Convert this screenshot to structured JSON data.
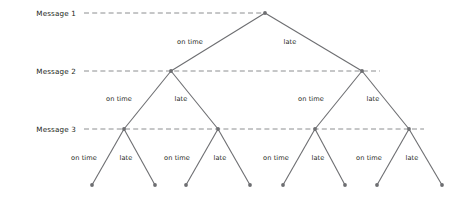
{
  "figure": {
    "type": "decision-tree-diagram",
    "width": 460,
    "height": 198,
    "background_color": "#ffffff",
    "stroke_color": "#6d6e71",
    "text_color": "#231f20",
    "dash_color": "#808285"
  },
  "levels": [
    {
      "id": "message-1",
      "label": "Message 1",
      "y": 13,
      "label_x": 76,
      "line_from_x": 84,
      "line_to_x": 265
    },
    {
      "id": "message-2",
      "label": "Message 2",
      "y": 71,
      "label_x": 76,
      "line_from_x": 84,
      "line_to_x": 380
    },
    {
      "id": "message-3",
      "label": "Message 3",
      "y": 129,
      "label_x": 76,
      "line_from_x": 84,
      "line_to_x": 424
    }
  ],
  "nodes": [
    {
      "id": "n0",
      "level": 0,
      "x": 265,
      "y": 13
    },
    {
      "id": "n1",
      "level": 1,
      "x": 171,
      "y": 71
    },
    {
      "id": "n2",
      "level": 1,
      "x": 362,
      "y": 71
    },
    {
      "id": "n11",
      "level": 2,
      "x": 124,
      "y": 129
    },
    {
      "id": "n12",
      "level": 2,
      "x": 218,
      "y": 129
    },
    {
      "id": "n21",
      "level": 2,
      "x": 315,
      "y": 129
    },
    {
      "id": "n22",
      "level": 2,
      "x": 409,
      "y": 129
    },
    {
      "id": "leaf1",
      "level": 3,
      "x": 92,
      "y": 185
    },
    {
      "id": "leaf2",
      "level": 3,
      "x": 155,
      "y": 185
    },
    {
      "id": "leaf3",
      "level": 3,
      "x": 186,
      "y": 185
    },
    {
      "id": "leaf4",
      "level": 3,
      "x": 250,
      "y": 185
    },
    {
      "id": "leaf5",
      "level": 3,
      "x": 283,
      "y": 185
    },
    {
      "id": "leaf6",
      "level": 3,
      "x": 345,
      "y": 185
    },
    {
      "id": "leaf7",
      "level": 3,
      "x": 377,
      "y": 185
    },
    {
      "id": "leaf8",
      "level": 3,
      "x": 442,
      "y": 185
    }
  ],
  "edges": [
    {
      "id": "e-n0-n1",
      "from": "n0",
      "to": "n1",
      "label": "on time",
      "label_x": 190,
      "label_y": 42
    },
    {
      "id": "e-n0-n2",
      "from": "n0",
      "to": "n2",
      "label": "late",
      "label_x": 290,
      "label_y": 42
    },
    {
      "id": "e-n1-n11",
      "from": "n1",
      "to": "n11",
      "label": "on time",
      "label_x": 119,
      "label_y": 99
    },
    {
      "id": "e-n1-n12",
      "from": "n1",
      "to": "n12",
      "label": "late",
      "label_x": 181,
      "label_y": 99
    },
    {
      "id": "e-n2-n21",
      "from": "n2",
      "to": "n21",
      "label": "on time",
      "label_x": 311,
      "label_y": 99
    },
    {
      "id": "e-n2-n22",
      "from": "n2",
      "to": "n22",
      "label": "late",
      "label_x": 373,
      "label_y": 99
    },
    {
      "id": "e-n11-leaf1",
      "from": "n11",
      "to": "leaf1",
      "label": "on time",
      "label_x": 84,
      "label_y": 158
    },
    {
      "id": "e-n11-leaf2",
      "from": "n11",
      "to": "leaf2",
      "label": "late",
      "label_x": 126,
      "label_y": 158
    },
    {
      "id": "e-n12-leaf3",
      "from": "n12",
      "to": "leaf3",
      "label": "on time",
      "label_x": 177,
      "label_y": 158
    },
    {
      "id": "e-n12-leaf4",
      "from": "n12",
      "to": "leaf4",
      "label": "late",
      "label_x": 220,
      "label_y": 158
    },
    {
      "id": "e-n21-leaf5",
      "from": "n21",
      "to": "leaf5",
      "label": "on time",
      "label_x": 276,
      "label_y": 158
    },
    {
      "id": "e-n21-leaf6",
      "from": "n21",
      "to": "leaf6",
      "label": "late",
      "label_x": 318,
      "label_y": 158
    },
    {
      "id": "e-n22-leaf7",
      "from": "n22",
      "to": "leaf7",
      "label": "on time",
      "label_x": 369,
      "label_y": 158
    },
    {
      "id": "e-n22-leaf8",
      "from": "n22",
      "to": "leaf8",
      "label": "late",
      "label_x": 412,
      "label_y": 158
    }
  ]
}
